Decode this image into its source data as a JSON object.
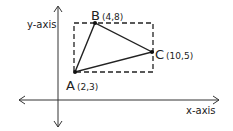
{
  "diagram": {
    "type": "coordinate-plane-triangle",
    "axes": {
      "x_label": "x-axis",
      "y_label": "y-axis"
    },
    "points": [
      {
        "name": "A",
        "coords": "(2,3)",
        "x": 2,
        "y": 3
      },
      {
        "name": "B",
        "coords": "(4,8)",
        "x": 4,
        "y": 8
      },
      {
        "name": "C",
        "coords": "(10,5)",
        "x": 10,
        "y": 5
      }
    ],
    "bounding_box": {
      "style": "dashed",
      "x_min": 2,
      "x_max": 10,
      "y_min": 3,
      "y_max": 8
    },
    "colors": {
      "stroke": "#222222",
      "background": "#ffffff"
    }
  }
}
